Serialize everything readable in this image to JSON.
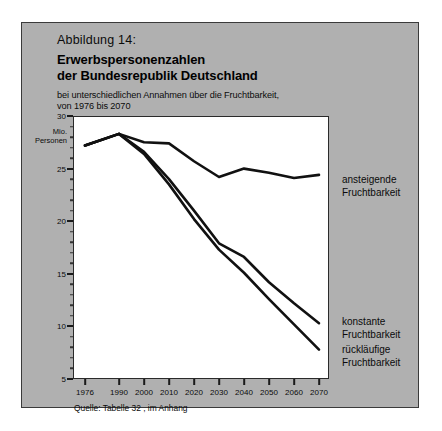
{
  "figure": {
    "number_label": "Abbildung 14:",
    "title_line1": "Erwerbspersonenzahlen",
    "title_line2": "der Bundesrepublik Deutschland",
    "subtitle_line1": "bei unterschiedlichen Annahmen über die Fruchtbarkeit,",
    "subtitle_line2": "von 1976 bis 2070",
    "source": "Quelle: Tabelle 32 , im Anhang",
    "panel_color": "#b0b0b0",
    "plot_color": "#ffffff",
    "line_color": "#111111"
  },
  "chart_data": {
    "type": "line",
    "title": "Erwerbspersonenzahlen der Bundesrepublik Deutschland",
    "subtitle": "bei unterschiedlichen Annahmen über die Fruchtbarkeit, von 1976 bis 2070",
    "xlabel": "",
    "ylabel": "Mio. Personen",
    "ylabel_line1": "Mio.",
    "ylabel_line2": "Personen",
    "x": [
      1976,
      1990,
      2000,
      2010,
      2020,
      2030,
      2040,
      2050,
      2060,
      2070
    ],
    "xlim": [
      1976,
      2070
    ],
    "ylim": [
      5,
      30
    ],
    "yticks": [
      30,
      25,
      20,
      15,
      10,
      5
    ],
    "yticks_minor": [
      29,
      28,
      27,
      26,
      24,
      23,
      22,
      21,
      19,
      18,
      17,
      16,
      14,
      13,
      12,
      11,
      9,
      8,
      7,
      6
    ],
    "xticks": [
      1976,
      1990,
      2000,
      2010,
      2020,
      2030,
      2040,
      2050,
      2060,
      2070
    ],
    "xtick_labels": [
      "1976",
      "1990",
      "2000",
      "2010",
      "2020",
      "2030",
      "2040",
      "2050",
      "2060",
      "2070"
    ],
    "grid": false,
    "legend_position": "right",
    "series": [
      {
        "name": "ansteigende Fruchtbarkeit",
        "label_line1": "ansteigende",
        "label_line2": "Fruchtbarkeit",
        "values": [
          27.2,
          28.3,
          27.5,
          27.4,
          25.7,
          24.2,
          25.0,
          24.6,
          24.1,
          24.4
        ]
      },
      {
        "name": "konstante Fruchtbarkeit",
        "label_line1": "konstante",
        "label_line2": "Fruchtbarkeit",
        "values": [
          27.2,
          28.3,
          26.6,
          24.0,
          21.0,
          17.9,
          16.6,
          14.2,
          12.2,
          10.3
        ]
      },
      {
        "name": "rückläufige Fruchtbarkeit",
        "label_line1": "rückläufige",
        "label_line2": "Fruchtbarkeit",
        "values": [
          27.2,
          28.3,
          26.4,
          23.5,
          20.2,
          17.3,
          15.1,
          12.6,
          10.2,
          7.8
        ]
      }
    ]
  }
}
